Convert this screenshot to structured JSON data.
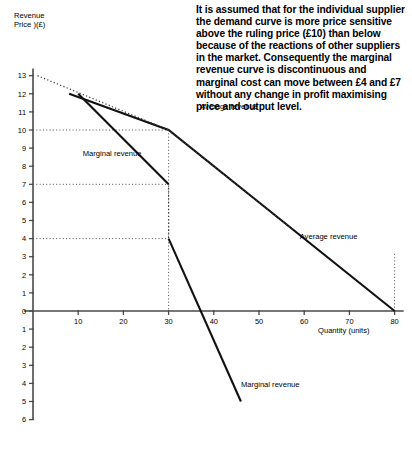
{
  "note": {
    "text": "It is assumed that for the individual supplier the demand curve is more price sensitive above the ruling price (£10) than below because of the reactions of other suppliers in the market. Consequently the marginal revenue curve is discontinuous and marginal cost can move between £4 and £7 without any change in profit maximising price and output level."
  },
  "chart_data": {
    "type": "line",
    "title": "",
    "xlabel": "Quantity (units)",
    "ylabel": "Revenue\nPrice )(£)",
    "xlim": [
      0,
      82
    ],
    "ylim": [
      -6,
      13.4
    ],
    "grid": false,
    "legend_position": "inline-annotations",
    "xticks": [
      10,
      20,
      30,
      40,
      50,
      60,
      70,
      80
    ],
    "yticks": [
      13,
      12,
      11,
      10,
      9,
      8,
      7,
      6,
      5,
      4,
      3,
      2,
      1,
      0,
      -1,
      -2,
      -3,
      -4,
      -5,
      -6
    ],
    "ytick_labels": [
      "13",
      "12",
      "11",
      "10",
      "9",
      "8",
      "7",
      "6",
      "5",
      "4",
      "3",
      "2",
      "1",
      "0",
      "1",
      "2",
      "3",
      "4",
      "5",
      "6"
    ],
    "ruling_price": 10,
    "ruling_quantity": 30,
    "mr_discontinuity": [
      4,
      7
    ],
    "series": [
      {
        "name": "Average revenue",
        "style": "solid",
        "points": [
          [
            8,
            12
          ],
          [
            30,
            10
          ],
          [
            80,
            0
          ]
        ]
      },
      {
        "name": "Average revenue upper extension",
        "style": "dotted",
        "points": [
          [
            1,
            13
          ],
          [
            30,
            10
          ]
        ]
      },
      {
        "name": "Average revenue lower extension",
        "style": "dotted",
        "points": [
          [
            30,
            10
          ],
          [
            57.5,
            4.5
          ]
        ]
      },
      {
        "name": "Marginal revenue",
        "style": "solid",
        "points": [
          [
            10,
            12
          ],
          [
            30,
            7
          ]
        ]
      },
      {
        "name": "Marginal revenue lower segment",
        "style": "solid",
        "points": [
          [
            30,
            4
          ],
          [
            46,
            -5
          ]
        ]
      },
      {
        "name": "Marginal revenue discontinuity",
        "style": "dotted",
        "points": [
          [
            30,
            7
          ],
          [
            30,
            4
          ]
        ]
      }
    ],
    "guides": [
      {
        "name": "price-10-guide",
        "from": [
          0,
          10
        ],
        "to": [
          30,
          10
        ]
      },
      {
        "name": "price-7-guide",
        "from": [
          0,
          7
        ],
        "to": [
          30,
          7
        ]
      },
      {
        "name": "price-4-guide",
        "from": [
          0,
          4
        ],
        "to": [
          30,
          4
        ]
      },
      {
        "name": "quantity-30-guide",
        "from": [
          30,
          10
        ],
        "to": [
          30,
          0
        ]
      },
      {
        "name": "quantity-80-guide",
        "from": [
          80,
          0
        ],
        "to": [
          80,
          3.2
        ]
      }
    ],
    "annotations": [
      {
        "name": "average-revenue-upper",
        "text": "Average revenue",
        "x": 37,
        "y": 11.3
      },
      {
        "name": "marginal-revenue-upper",
        "text": "Marginal revenue",
        "x": 11,
        "y": 8.7
      },
      {
        "name": "average-revenue-lower",
        "text": "Average revenue",
        "x": 59,
        "y": 4.1
      },
      {
        "name": "marginal-revenue-lower",
        "text": "Marginal revenue",
        "x": 46,
        "y": -4.1
      }
    ]
  }
}
